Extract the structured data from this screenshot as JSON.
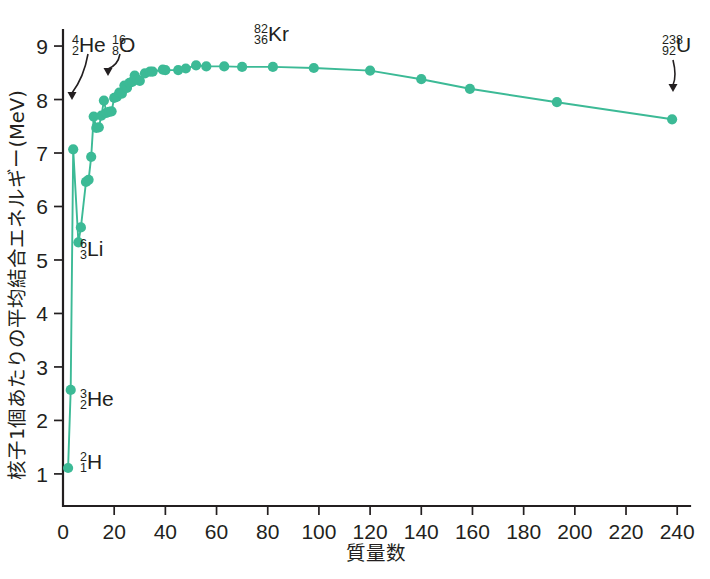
{
  "chart_data": {
    "type": "line",
    "title": "",
    "xlabel": "質量数",
    "ylabel": "核子1個あたりの平均結合エネルギー(MeV)",
    "xlim": [
      0,
      245
    ],
    "ylim": [
      0.4,
      9.3
    ],
    "xticks": [
      0,
      20,
      40,
      60,
      80,
      100,
      120,
      140,
      160,
      180,
      200,
      220,
      240
    ],
    "yticks": [
      1,
      2,
      3,
      4,
      5,
      6,
      7,
      8,
      9
    ],
    "xticklabels": [
      "0",
      "20",
      "40",
      "60",
      "80",
      "100",
      "120",
      "140",
      "160",
      "180",
      "200",
      "220",
      "240"
    ],
    "yticklabels": [
      "1",
      "2",
      "3",
      "4",
      "5",
      "6",
      "7",
      "8",
      "9"
    ],
    "grid": false,
    "legend": false,
    "series_color": "#3cba96",
    "marker_color": "#3cba96",
    "series": [
      {
        "name": "binding energy per nucleon",
        "x": [
          2,
          3,
          4,
          6,
          7,
          9,
          10,
          11,
          12,
          13,
          14,
          15,
          16,
          17,
          18,
          19,
          20,
          21,
          22,
          23,
          24,
          25,
          26,
          27,
          28,
          29,
          30,
          32,
          34,
          35,
          39,
          40,
          45,
          48,
          52,
          56,
          63,
          70,
          82,
          98,
          120,
          140,
          159,
          193,
          238
        ],
        "y": [
          1.11,
          2.57,
          7.07,
          5.33,
          5.61,
          6.46,
          6.5,
          6.93,
          7.68,
          7.47,
          7.48,
          7.7,
          7.98,
          7.75,
          7.77,
          7.78,
          8.03,
          8.05,
          8.13,
          8.11,
          8.26,
          8.22,
          8.31,
          8.33,
          8.45,
          8.37,
          8.35,
          8.49,
          8.52,
          8.52,
          8.56,
          8.55,
          8.55,
          8.58,
          8.64,
          8.62,
          8.62,
          8.61,
          8.61,
          8.59,
          8.54,
          8.38,
          8.2,
          7.95,
          7.63
        ]
      }
    ],
    "annotations": [
      {
        "name": "helium-4",
        "sup": "4",
        "sub": "2",
        "element": "He",
        "x": 4,
        "y": 7.07,
        "label_x": 72,
        "label_y": 44,
        "arrow": {
          "x1": 88,
          "y1": 54,
          "x2": 72,
          "y2": 100
        }
      },
      {
        "name": "oxygen-16",
        "sup": "16",
        "sub": "8",
        "element": "O",
        "x": 16,
        "y": 7.98,
        "label_x": 112,
        "label_y": 44,
        "arrow": {
          "x1": 120,
          "y1": 54,
          "x2": 108,
          "y2": 76
        }
      },
      {
        "name": "lithium-6",
        "sup": "6",
        "sub": "3",
        "element": "Li",
        "x": 6,
        "y": 5.33,
        "label_x": 80,
        "label_y": 248,
        "arrow": null
      },
      {
        "name": "helium-3",
        "sup": "3",
        "sub": "2",
        "element": "He",
        "x": 3,
        "y": 2.57,
        "label_x": 80,
        "label_y": 398,
        "arrow": null
      },
      {
        "name": "hydrogen-2",
        "sup": "2",
        "sub": "1",
        "element": "H",
        "x": 2,
        "y": 1.11,
        "label_x": 80,
        "label_y": 461,
        "arrow": null
      },
      {
        "name": "krypton-82",
        "sup": "82",
        "sub": "36",
        "element": "Kr",
        "x": 82,
        "y": 8.61,
        "label_x": 254,
        "label_y": 33,
        "arrow": null
      },
      {
        "name": "uranium-238",
        "sup": "238",
        "sub": "92",
        "element": "U",
        "x": 238,
        "y": 7.63,
        "label_x": 662,
        "label_y": 44,
        "arrow": {
          "x1": 673,
          "y1": 60,
          "x2": 673,
          "y2": 92
        }
      }
    ]
  },
  "axes": {
    "x_title": "質量数",
    "y_title": "核子1個あたりの平均結合エネルギー(MeV)"
  }
}
